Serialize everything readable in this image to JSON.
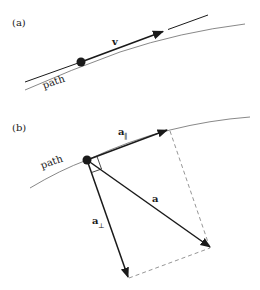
{
  "panels": {
    "a": {
      "label": "(a)",
      "velocity_label": "v",
      "path_label": "path"
    },
    "b": {
      "label": "(b)",
      "path_label": "path",
      "a_parallel_base": "a",
      "a_parallel_sub": "‖",
      "a_perp_base": "a",
      "a_perp_sub": "⊥",
      "a_label": "a"
    }
  },
  "colors": {
    "ink": "#1a1a1a",
    "path": "#7a7a7a",
    "dash": "#8a8a8a"
  }
}
